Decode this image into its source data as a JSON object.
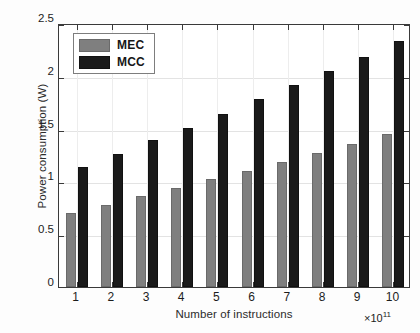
{
  "chart_data": {
    "type": "bar",
    "title": "",
    "xlabel": "Number of instructions",
    "ylabel": "Power consumption (W)",
    "x_exponent_prefix": "×10",
    "x_exponent_power": "11",
    "categories": [
      "1",
      "2",
      "3",
      "4",
      "5",
      "6",
      "7",
      "8",
      "9",
      "10"
    ],
    "ylim": [
      0,
      2.5
    ],
    "xlim": [
      0.5,
      10.5
    ],
    "yticks": [
      "0",
      "0.5",
      "1",
      "1.5",
      "2",
      "2.5"
    ],
    "ytick_values": [
      0,
      0.5,
      1,
      1.5,
      2,
      2.5
    ],
    "grid": true,
    "legend_position": "upper left",
    "series": [
      {
        "name": "MEC",
        "color": "#7f7f7f",
        "values": [
          0.7,
          0.78,
          0.86,
          0.94,
          1.02,
          1.1,
          1.18,
          1.27,
          1.35,
          1.45
        ]
      },
      {
        "name": "MCC",
        "color": "#1a1a1a",
        "values": [
          1.14,
          1.26,
          1.39,
          1.51,
          1.64,
          1.78,
          1.91,
          2.05,
          2.18,
          2.33
        ]
      }
    ]
  },
  "legend": {
    "items": [
      {
        "label": "MEC",
        "color": "#7f7f7f"
      },
      {
        "label": "MCC",
        "color": "#1a1a1a"
      }
    ]
  },
  "axes": {
    "frame_color": "#3a3a3a",
    "grid_color": "#e3e3e3"
  }
}
